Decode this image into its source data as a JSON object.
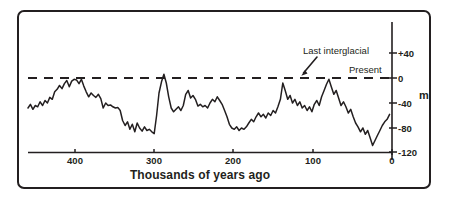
{
  "chart_data": {
    "type": "line",
    "title": "",
    "xlabel": "Thousands of years ago",
    "ylabel": "m",
    "xlim": [
      450,
      0
    ],
    "ylim": [
      -135,
      55
    ],
    "x_ticks": [
      400,
      300,
      200,
      100,
      0
    ],
    "x_tick_labels": [
      "400",
      "300",
      "200",
      "100",
      "0"
    ],
    "y_ticks": [
      40,
      0,
      -40,
      -80,
      -120
    ],
    "y_tick_labels": [
      "+40",
      "0",
      "-40",
      "-80",
      "-120"
    ],
    "grid": false,
    "legend": "none",
    "x_axis_reversed": true,
    "series": [
      {
        "name": "Sea level",
        "units": "m",
        "color": "#231f20",
        "points": [
          [
            450,
            -48
          ],
          [
            447,
            -42
          ],
          [
            444,
            -50
          ],
          [
            441,
            -44
          ],
          [
            438,
            -46
          ],
          [
            435,
            -38
          ],
          [
            432,
            -44
          ],
          [
            429,
            -36
          ],
          [
            426,
            -40
          ],
          [
            423,
            -31
          ],
          [
            420,
            -34
          ],
          [
            417,
            -22
          ],
          [
            414,
            -18
          ],
          [
            411,
            -12
          ],
          [
            408,
            -17
          ],
          [
            405,
            -9
          ],
          [
            402,
            -4
          ],
          [
            399,
            -14
          ],
          [
            396,
            -5
          ],
          [
            393,
            -2
          ],
          [
            390,
            -3
          ],
          [
            387,
            -9
          ],
          [
            384,
            -2
          ],
          [
            381,
            -13
          ],
          [
            378,
            -22
          ],
          [
            375,
            -30
          ],
          [
            372,
            -24
          ],
          [
            369,
            -28
          ],
          [
            366,
            -31
          ],
          [
            363,
            -26
          ],
          [
            360,
            -33
          ],
          [
            357,
            -48
          ],
          [
            354,
            -40
          ],
          [
            351,
            -44
          ],
          [
            348,
            -43
          ],
          [
            345,
            -46
          ],
          [
            342,
            -48
          ],
          [
            339,
            -47
          ],
          [
            336,
            -52
          ],
          [
            333,
            -68
          ],
          [
            330,
            -76
          ],
          [
            327,
            -70
          ],
          [
            324,
            -82
          ],
          [
            321,
            -74
          ],
          [
            318,
            -86
          ],
          [
            315,
            -72
          ],
          [
            312,
            -80
          ],
          [
            309,
            -85
          ],
          [
            306,
            -78
          ],
          [
            303,
            -84
          ],
          [
            300,
            -82
          ],
          [
            297,
            -86
          ],
          [
            294,
            -89
          ],
          [
            291,
            -60
          ],
          [
            288,
            -24
          ],
          [
            285,
            -6
          ],
          [
            282,
            6
          ],
          [
            279,
            -8
          ],
          [
            276,
            -30
          ],
          [
            273,
            -48
          ],
          [
            270,
            -54
          ],
          [
            267,
            -50
          ],
          [
            264,
            -46
          ],
          [
            261,
            -52
          ],
          [
            258,
            -44
          ],
          [
            255,
            -26
          ],
          [
            252,
            -20
          ],
          [
            249,
            -32
          ],
          [
            246,
            -28
          ],
          [
            243,
            -34
          ],
          [
            240,
            -45
          ],
          [
            237,
            -42
          ],
          [
            234,
            -46
          ],
          [
            231,
            -44
          ],
          [
            228,
            -48
          ],
          [
            225,
            -40
          ],
          [
            222,
            -34
          ],
          [
            219,
            -38
          ],
          [
            216,
            -30
          ],
          [
            213,
            -36
          ],
          [
            210,
            -42
          ],
          [
            207,
            -52
          ],
          [
            204,
            -62
          ],
          [
            201,
            -74
          ],
          [
            198,
            -80
          ],
          [
            195,
            -82
          ],
          [
            192,
            -78
          ],
          [
            189,
            -84
          ],
          [
            186,
            -80
          ],
          [
            183,
            -82
          ],
          [
            180,
            -78
          ],
          [
            177,
            -72
          ],
          [
            174,
            -66
          ],
          [
            171,
            -70
          ],
          [
            168,
            -62
          ],
          [
            165,
            -56
          ],
          [
            162,
            -62
          ],
          [
            159,
            -58
          ],
          [
            156,
            -64
          ],
          [
            153,
            -56
          ],
          [
            150,
            -60
          ],
          [
            147,
            -52
          ],
          [
            144,
            -56
          ],
          [
            141,
            -46
          ],
          [
            138,
            -34
          ],
          [
            135,
            -8
          ],
          [
            132,
            -20
          ],
          [
            129,
            -34
          ],
          [
            126,
            -28
          ],
          [
            123,
            -40
          ],
          [
            120,
            -34
          ],
          [
            117,
            -44
          ],
          [
            114,
            -38
          ],
          [
            111,
            -48
          ],
          [
            108,
            -44
          ],
          [
            105,
            -52
          ],
          [
            102,
            -46
          ],
          [
            99,
            -54
          ],
          [
            96,
            -42
          ],
          [
            93,
            -36
          ],
          [
            90,
            -44
          ],
          [
            87,
            -30
          ],
          [
            84,
            -20
          ],
          [
            81,
            -10
          ],
          [
            78,
            -2
          ],
          [
            75,
            -14
          ],
          [
            72,
            -26
          ],
          [
            69,
            -20
          ],
          [
            66,
            -32
          ],
          [
            63,
            -44
          ],
          [
            60,
            -38
          ],
          [
            57,
            -46
          ],
          [
            54,
            -56
          ],
          [
            51,
            -50
          ],
          [
            48,
            -62
          ],
          [
            45,
            -72
          ],
          [
            42,
            -78
          ],
          [
            39,
            -86
          ],
          [
            36,
            -80
          ],
          [
            33,
            -90
          ],
          [
            30,
            -84
          ],
          [
            27,
            -96
          ],
          [
            24,
            -108
          ],
          [
            21,
            -100
          ],
          [
            18,
            -92
          ],
          [
            15,
            -84
          ],
          [
            12,
            -76
          ],
          [
            9,
            -70
          ],
          [
            6,
            -66
          ],
          [
            3,
            -58
          ]
        ]
      }
    ],
    "reference_lines": [
      {
        "name": "present-sea-level",
        "value": 0,
        "style": "dashed",
        "label": "Present"
      }
    ],
    "annotations": [
      {
        "name": "last-interglacial",
        "text": "Last interglacial",
        "x": 125,
        "y": 0
      },
      {
        "name": "present",
        "text": "Present",
        "x": 30,
        "y": 0
      }
    ]
  },
  "axis": {
    "x_title": "Thousands of years ago",
    "y_unit": "m",
    "x_tick_labels": [
      "400",
      "300",
      "200",
      "100",
      "0"
    ],
    "y_tick_labels": [
      "+40",
      "0",
      "-40",
      "-80",
      "-120"
    ]
  },
  "annotations": {
    "last_interglacial": "Last interglacial",
    "present": "Present"
  },
  "colors": {
    "line": "#231f20",
    "frame": "#231f20",
    "axis": "#231f20",
    "background": "#ffffff"
  }
}
